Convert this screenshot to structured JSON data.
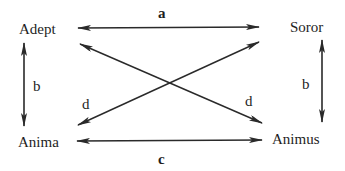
{
  "diagram": {
    "nodes": {
      "adept": {
        "label": "Adept",
        "x": 19,
        "y": 21
      },
      "soror": {
        "label": "Soror",
        "x": 290,
        "y": 19
      },
      "anima": {
        "label": "Anima",
        "x": 18,
        "y": 134
      },
      "animus": {
        "label": "Animus",
        "x": 272,
        "y": 131
      }
    },
    "edges": {
      "a": {
        "label": "a",
        "from": "adept",
        "to": "soror",
        "bidirectional": true
      },
      "b_left": {
        "label": "b",
        "from": "adept",
        "to": "anima",
        "bidirectional": true
      },
      "b_right": {
        "label": "b",
        "from": "soror",
        "to": "animus",
        "bidirectional": true
      },
      "c": {
        "label": "c",
        "from": "anima",
        "to": "animus",
        "bidirectional": true
      },
      "d_left": {
        "label": "d",
        "from": "anima",
        "to": "soror",
        "bidirectional": true
      },
      "d_right": {
        "label": "d",
        "from": "adept",
        "to": "animus",
        "bidirectional": true
      }
    },
    "colors": {
      "line": "#2a2a2a",
      "text": "#1e1e1e",
      "background": "#ffffff"
    }
  }
}
